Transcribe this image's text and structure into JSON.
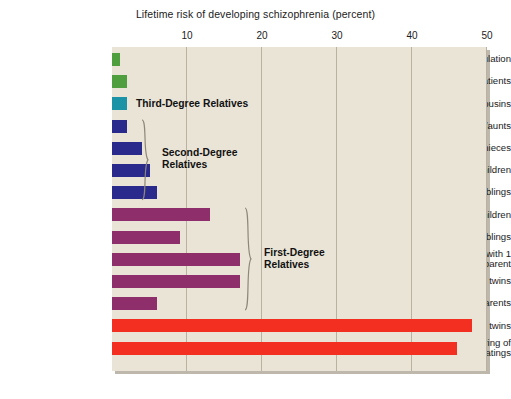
{
  "chart_data": {
    "type": "bar",
    "orientation": "horizontal",
    "title": "Lifetime risk of developing schizophrenia (percent)",
    "xlabel": "",
    "ylabel": "",
    "xlim": [
      0,
      50
    ],
    "xticks": [
      10,
      20,
      30,
      40,
      50
    ],
    "grid": true,
    "legend": "none",
    "categories": [
      "General population",
      "Spouses of patients",
      "First cousins",
      "Uncles/aunts",
      "Nephews/nieces",
      "Grandchildren",
      "Half siblings",
      "Children",
      "Siblings",
      "Siblings with 1\nschizophrenic parent",
      "DZ twins",
      "Parents",
      "MZ twins",
      "Offspring of\ndual matings"
    ],
    "values": [
      1,
      2,
      2,
      2,
      4,
      5,
      6,
      13,
      9,
      17,
      17,
      6,
      48,
      46
    ],
    "colors": [
      "#4f9f3f",
      "#4f9f3f",
      "#1a93a6",
      "#2a2a8c",
      "#2a2a8c",
      "#2a2a8c",
      "#2a2a8c",
      "#8e2f6b",
      "#8e2f6b",
      "#8e2f6b",
      "#8e2f6b",
      "#8e2f6b",
      "#f22f20",
      "#f22f20"
    ],
    "annotations": [
      {
        "text": "Third-Degree Relatives",
        "covers": [
          "First cousins"
        ]
      },
      {
        "text": "Second-Degree\nRelatives",
        "covers": [
          "Uncles/aunts",
          "Nephews/nieces",
          "Grandchildren",
          "Half siblings"
        ]
      },
      {
        "text": "First-Degree\nRelatives",
        "covers": [
          "Children",
          "Siblings",
          "Siblings with 1 schizophrenic parent",
          "DZ twins",
          "Parents"
        ]
      }
    ]
  },
  "style": {
    "plot_background": "#e9e4d6",
    "grid_color": "#b9b2a0",
    "page_background": "#ffffff",
    "text_color": "#1b1b1b"
  }
}
